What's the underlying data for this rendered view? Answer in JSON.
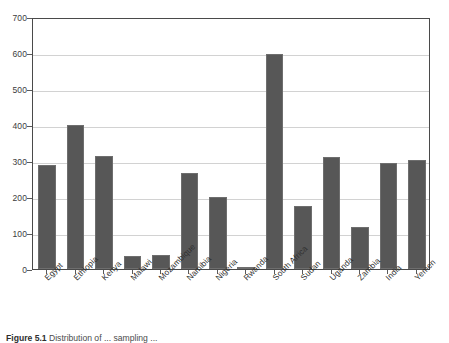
{
  "chart_data": {
    "type": "bar",
    "title": "",
    "xlabel": "",
    "ylabel": "",
    "ylim": [
      0,
      700
    ],
    "yticks": [
      0,
      100,
      200,
      300,
      400,
      500,
      600,
      700
    ],
    "ytick_labels": [
      "0",
      "100",
      "200",
      "300",
      "400",
      "500",
      "600",
      "700"
    ],
    "grid": true,
    "legend": false,
    "bar_color": "#575757",
    "categories": [
      "Egypt",
      "Ethiopia",
      "Kenya",
      "Malawi",
      "Mozambique",
      "Namibia",
      "Nigeria",
      "Rwanda",
      "South Africa",
      "Sudan",
      "Uganda",
      "Zambia",
      "India",
      "Yemen"
    ],
    "values": [
      288,
      400,
      315,
      36,
      40,
      267,
      200,
      5,
      598,
      176,
      312,
      117,
      294,
      302
    ]
  },
  "caption": {
    "label": "Figure 5.1",
    "text": "Distribution of ... sampling ..."
  }
}
